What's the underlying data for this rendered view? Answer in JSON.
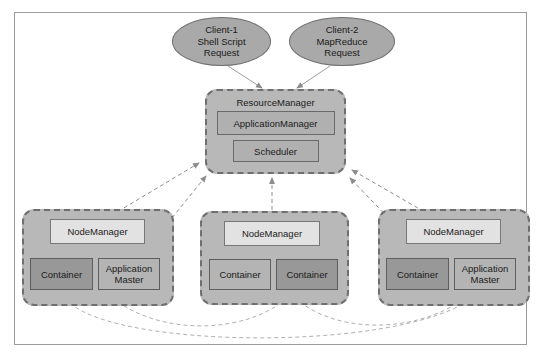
{
  "diagram": {
    "frame": {
      "border_color": "#9a9a9a",
      "background": "#ffffff"
    },
    "palette": {
      "client_fill": "#a9a9a9",
      "group_fill": "#b8b8b8",
      "group_border": "#6f6f6f",
      "inner_fill": "#b0b0b0",
      "nodemanager_fill": "#e2e2e2",
      "container_dark": "#989898",
      "container_light": "#b4b4b4",
      "edge_color": "#8d8d8d"
    },
    "clients": [
      {
        "id": "client-1",
        "lines": [
          "Client-1",
          "Shell Script",
          "Request"
        ]
      },
      {
        "id": "client-2",
        "lines": [
          "Client-2",
          "MapReduce",
          "Request"
        ]
      }
    ],
    "resource_manager": {
      "title": "ResourceManager",
      "components": [
        {
          "id": "application-manager",
          "label": "ApplicationManager"
        },
        {
          "id": "scheduler",
          "label": "Scheduler"
        }
      ]
    },
    "node_managers": [
      {
        "id": "node-manager-1",
        "label": "NodeManager",
        "slots": [
          {
            "id": "container",
            "lines": [
              "Container"
            ],
            "shade": "dark"
          },
          {
            "id": "application-master",
            "lines": [
              "Application",
              "Master"
            ],
            "shade": "light"
          }
        ]
      },
      {
        "id": "node-manager-2",
        "label": "NodeManager",
        "slots": [
          {
            "id": "container-a",
            "lines": [
              "Container"
            ],
            "shade": "light"
          },
          {
            "id": "container-b",
            "lines": [
              "Container"
            ],
            "shade": "dark"
          }
        ]
      },
      {
        "id": "node-manager-3",
        "label": "NodeManager",
        "slots": [
          {
            "id": "container",
            "lines": [
              "Container"
            ],
            "shade": "dark"
          },
          {
            "id": "application-master",
            "lines": [
              "Application",
              "Master"
            ],
            "shade": "light"
          }
        ]
      }
    ],
    "edges": {
      "client_to_rm": 2,
      "nodemanager_to_rm": 3,
      "nodemanager_to_nodemanager": 3
    }
  }
}
